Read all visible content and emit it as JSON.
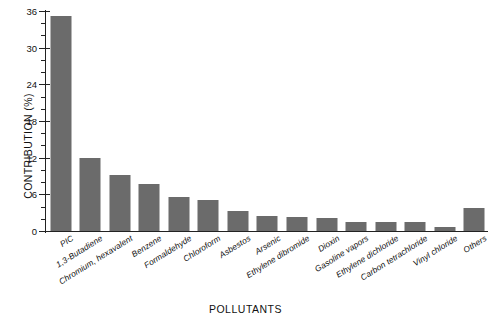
{
  "chart_data": {
    "type": "bar",
    "title": "",
    "xlabel": "POLLUTANTS",
    "ylabel": "CONTRIBUTION (%)",
    "categories": [
      "PIC",
      "1,3-Butadiene",
      "Chromium, hexavalent",
      "Benzene",
      "Formaldehyde",
      "Chloroform",
      "Asbestos",
      "Arsenic",
      "Ethylene dibromide",
      "Dioxin",
      "Gasoline vapors",
      "Ethylene dichloride",
      "Carbon tetrachloride",
      "Vinyl chloride",
      "Others"
    ],
    "values": [
      35.2,
      12.0,
      9.1,
      7.7,
      5.5,
      5.0,
      3.2,
      2.4,
      2.3,
      2.1,
      1.5,
      1.4,
      1.4,
      0.7,
      3.7
    ],
    "ylim": [
      0,
      36
    ],
    "yticks": [
      0,
      6,
      12,
      18,
      24,
      30,
      36
    ],
    "yticklabels": [
      "0",
      "6",
      "12",
      "18",
      "24",
      "30",
      "36"
    ],
    "yminor_step": 2,
    "grid": false,
    "legend": null,
    "bar_color": "#6b6b6b",
    "axis_color": "#222222"
  }
}
